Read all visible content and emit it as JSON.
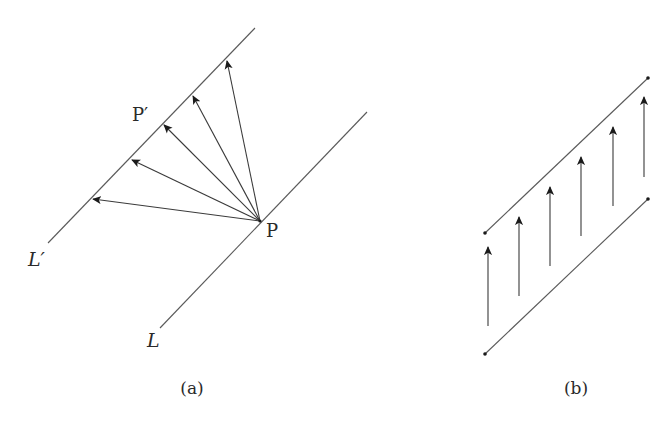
{
  "figure": {
    "panel_a": {
      "caption": "(a)",
      "caption_pos": [
        192,
        394
      ],
      "lines": [
        {
          "id": "L-prime",
          "label": "L′",
          "from": [
            48,
            243
          ],
          "to": [
            255,
            28
          ],
          "label_pos": [
            28,
            266
          ]
        },
        {
          "id": "L",
          "label": "L",
          "from": [
            160,
            328
          ],
          "to": [
            367,
            112
          ],
          "label_pos": [
            147,
            347
          ]
        }
      ],
      "point_P": {
        "label": "P",
        "pos": [
          260,
          221
        ],
        "label_pos": [
          266,
          237
        ]
      },
      "point_P_prime": {
        "label": "P′",
        "label_pos": [
          132,
          121
        ]
      },
      "arrows_from_P": [
        {
          "to": [
            93,
            199
          ]
        },
        {
          "to": [
            132,
            160
          ]
        },
        {
          "to": [
            164,
            125
          ]
        },
        {
          "to": [
            193,
            96
          ]
        },
        {
          "to": [
            227,
            61
          ]
        }
      ]
    },
    "panel_b": {
      "caption": "(b)",
      "caption_pos": [
        576,
        394
      ],
      "lines": [
        {
          "id": "upper",
          "from": [
            485,
            233
          ],
          "to": [
            648,
            78
          ]
        },
        {
          "id": "lower",
          "from": [
            485,
            354
          ],
          "to": [
            648,
            199
          ]
        }
      ],
      "endpoint_dots": [
        [
          485,
          233
        ],
        [
          648,
          78
        ],
        [
          485,
          354
        ],
        [
          648,
          199
        ]
      ],
      "vertical_arrows": [
        {
          "x": 488,
          "y_from": 326,
          "y_to": 247
        },
        {
          "x": 519,
          "y_from": 296,
          "y_to": 217
        },
        {
          "x": 550,
          "y_from": 266,
          "y_to": 187
        },
        {
          "x": 581,
          "y_from": 236,
          "y_to": 157
        },
        {
          "x": 613,
          "y_from": 206,
          "y_to": 127
        },
        {
          "x": 644,
          "y_from": 177,
          "y_to": 97
        }
      ]
    },
    "colors": {
      "line": "#5a5a5a",
      "arrow": "#3a3a3a",
      "text": "#2a2a2a",
      "background": "#ffffff"
    }
  }
}
